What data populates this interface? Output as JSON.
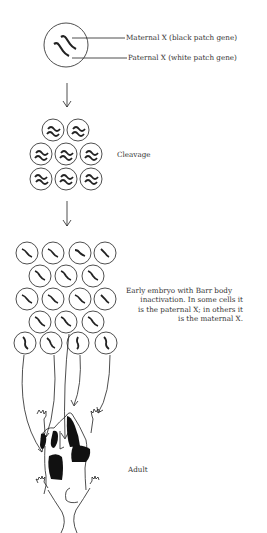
{
  "figure": {
    "zygote": {
      "maternal_label": "Maternal X (black patch gene)",
      "paternal_label": "Paternal X (white patch gene)"
    },
    "stages": [
      {
        "name": "cleavage",
        "label": "Cleavage"
      },
      {
        "name": "early-embryo",
        "label_lines": [
          "Early embryo with Barr body",
          "inactivation.  In some cells it",
          "is the paternal X; in others it",
          "is the maternal X."
        ]
      },
      {
        "name": "adult",
        "label": "Adult"
      }
    ],
    "colors": {
      "ink": "#222222",
      "background": "#ffffff",
      "patch": "#111111"
    }
  }
}
